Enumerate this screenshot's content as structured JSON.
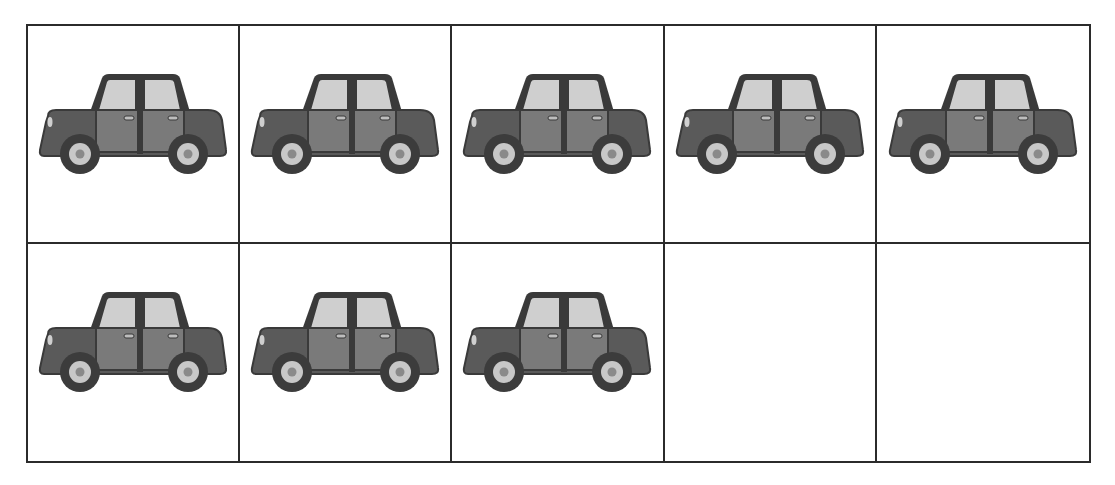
{
  "worksheet": {
    "type": "ten-frame",
    "columns": 5,
    "rows": 2,
    "total_cells": 10,
    "filled_count": 8,
    "empty_count": 2,
    "counter_object": "car-icon",
    "cells": [
      {
        "index": 0,
        "filled": true,
        "object": "car"
      },
      {
        "index": 1,
        "filled": true,
        "object": "car"
      },
      {
        "index": 2,
        "filled": true,
        "object": "car"
      },
      {
        "index": 3,
        "filled": true,
        "object": "car"
      },
      {
        "index": 4,
        "filled": true,
        "object": "car"
      },
      {
        "index": 5,
        "filled": true,
        "object": "car"
      },
      {
        "index": 6,
        "filled": true,
        "object": "car"
      },
      {
        "index": 7,
        "filled": true,
        "object": "car"
      },
      {
        "index": 8,
        "filled": false,
        "object": null
      },
      {
        "index": 9,
        "filled": false,
        "object": null
      }
    ]
  },
  "colors": {
    "grid_line": "#2b2b2b",
    "car_body": "#5a5a5a",
    "car_outline": "#3a3a3a",
    "car_door": "#7a7a7a",
    "car_window": "#cfcfcf",
    "tire": "#3c3c3c",
    "hubcap": "#c8c8c8",
    "hub_center": "#8a8a8a",
    "background": "#ffffff"
  }
}
